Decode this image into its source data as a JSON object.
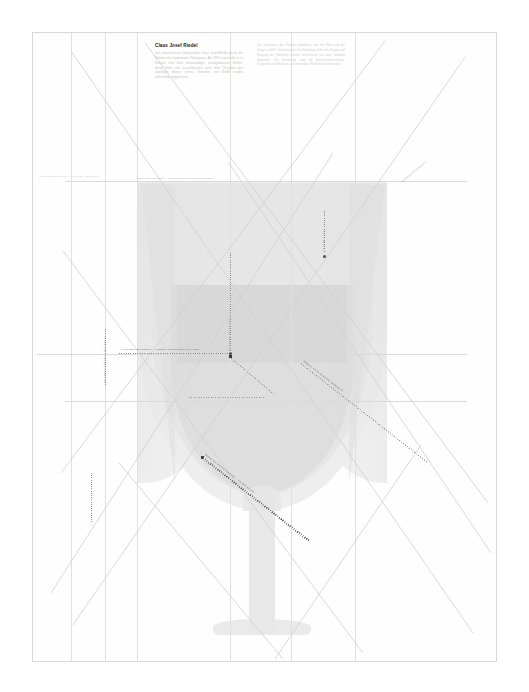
{
  "page": {
    "sheet_border_color": "#d8d8d8",
    "background": "#ffffff",
    "paper": "#fefefe"
  },
  "document": {
    "title": "Claus Josef Riedel",
    "columns": [
      {
        "id": "left",
        "paragraph": "Der österreichische Glasgestalter Claus Josef Riedel gilt als der Erfinder des funktionalen Weinglases. Ab 1958 entwickelte er in Kufstein eine Serie dünnwandiger, mundgeblasener Kelche, deren Form sich ausschliesslich nach dem Charakter des jeweiligen Weines richtet. Ornament und Schliff wurden vollständig weggelassen."
      },
      {
        "id": "right",
        "paragraph": "Die Geometrie des Kelches bestimmt, wie der Wein auf der Zunge auftrifft. Durchmesser der Mündung, Höhe der Kuppa und Neigung der Wandung werden rechnerisch aus dem Volumen abgeleitet. Die Zeichnung zeigt die Konstruktionsachsen, Tangenten und Radien, aus denen das Profil entwickelt wurde."
      }
    ],
    "footer_note": "Konstruktionszeichnung — Kelchprofil, Massstab 1:1"
  },
  "captions": {
    "top_left": "Oberer Rand der Kuppa — Tangentenpunkt der Konstruktionsachse",
    "upper_right": "Schnittpunkt der Diagonalen",
    "vertical_left": "Vertikale Hilfsachse — Symmetrie",
    "vertical_center": "Mittelachse des Kelches",
    "vertical_right": "Höhe der Kuppa",
    "horizontal_center": "Horizontale Bezugslinie — grösster Durchmesser der Kuppa",
    "diagonal_upper": "Tangente an die Wandung, Neigung 38°",
    "diagonal_lower": "Radius der unteren Rundung — Kreismittelpunkt",
    "diagonal_right": "Konstruktionsgerade zur Fusskante"
  },
  "geometry": {
    "glass": {
      "rim_y": 181,
      "bowl_top": 180,
      "bowl_bottom": 610,
      "stem_top": 492,
      "foot_y": 618
    },
    "guides": {
      "vertical_x": [
        70,
        104,
        136,
        229,
        290,
        354
      ],
      "horizontal_y": [
        180,
        353,
        400
      ]
    }
  },
  "colors": {
    "glass_light": "#ececec",
    "glass_mid": "#e4e4e4",
    "glass_dark": "#dcdcdc",
    "line": "#d9d9d9",
    "annotation": "#8a8a8a",
    "title": "#1a1a1a"
  }
}
